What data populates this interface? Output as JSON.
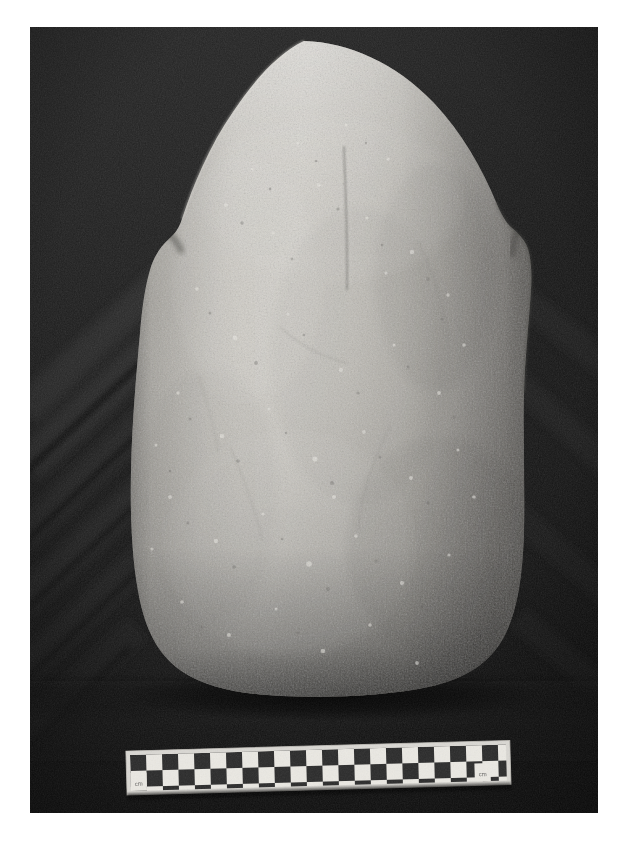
{
  "page": {
    "kind": "scanned-photograph-plate",
    "background_color": "#ffffff",
    "width": 626,
    "height": 842
  },
  "photograph": {
    "name": "stone-artifact-photograph",
    "description": "Black and white photograph of a large ovoid ground stone artifact resting on dark draped cloth",
    "frame": {
      "left": 30,
      "top": 27,
      "width": 568,
      "height": 786
    },
    "background_color": "#1c1c1c",
    "background_description": "dark draped textile with diagonal folds",
    "fold_count": 9,
    "tone_range": {
      "darkest": "#0d0d0d",
      "lightest": "#e2e0db"
    }
  },
  "artifact": {
    "name": "ovoid-ground-stone",
    "form": "ovoid / dome-topped slab with shouldered sides and flat base",
    "surface": "granular pecked and ground stone",
    "highlight_color": "#d7d4cd",
    "midtone_color": "#a9a6a0",
    "shadow_color": "#6d6b67",
    "features": [
      {
        "name": "left-shoulder-notch",
        "position": "left edge, upper third"
      },
      {
        "name": "right-shoulder-notch",
        "position": "right edge, upper third"
      },
      {
        "name": "central-vertical-groove",
        "position": "upper centre, faint incised line"
      },
      {
        "name": "basal-contact-shadow",
        "position": "bottom edge resting on cloth"
      }
    ]
  },
  "scale_bar": {
    "name": "photographic-scale-bar",
    "type": "two-row checkerboard photo scale",
    "rows": 2,
    "columns": 23,
    "square_size_px": 16,
    "tilt_degrees": -1.6,
    "light_color": "#efefe9",
    "dark_color": "#232323",
    "left_end_label": "cm",
    "right_end_label": "cm",
    "bounds": {
      "left": 128,
      "top": 752,
      "width": 376,
      "height": 40
    }
  },
  "caption": {
    "text": ""
  }
}
